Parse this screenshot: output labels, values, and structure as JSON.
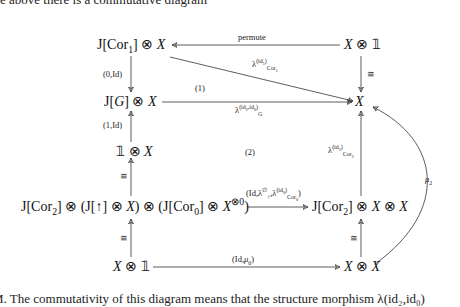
{
  "prose": {
    "top_line": "e above there is a commutative diagram",
    "bottom_line": "M. The commutativity of this diagram means that the structure morphism λ(id₂,id₀)"
  },
  "diagram": {
    "nodes": {
      "j_cor1_x": "J[Cor₁] ⊗ X",
      "x_unit_top": "X ⊗ 𝟙",
      "j_g_x": "J[G] ⊗ X",
      "x_center": "X",
      "unit_x": "𝟙 ⊗ X",
      "big_left": "J[Cor₂] ⊗ (J[↑] ⊗ X) ⊗ (J[Cor₀] ⊗ X⊗⁰)",
      "j_cor2_xx": "J[Cor₂] ⊗ X ⊗ X",
      "x_unit_bottom": "X ⊗ 𝟙",
      "x_x": "X ⊗ X"
    },
    "arrows": {
      "permute": "permute",
      "lambda_cor1": "λ^{id₁}_{Cor₁}",
      "iso_top_right": "≅",
      "zero_id": "(0,Id)",
      "lambda_g": "λ^{id₂,id₀}_G",
      "one_id": "(1,Id)",
      "iso_left_mid": "≅",
      "lambda_cor2": "λ^{id₂}_{Cor₂}",
      "mu2": "μ₂",
      "id_lambda": "(Id,λ^∅_↑,λ^{id₀}_{Cor₀})",
      "iso_left_bottom": "≅",
      "iso_right_bottom": "≅",
      "id_mu0": "(Id,μ₀)"
    },
    "region_labels": {
      "r1": "(1)",
      "r2": "(2)"
    }
  }
}
